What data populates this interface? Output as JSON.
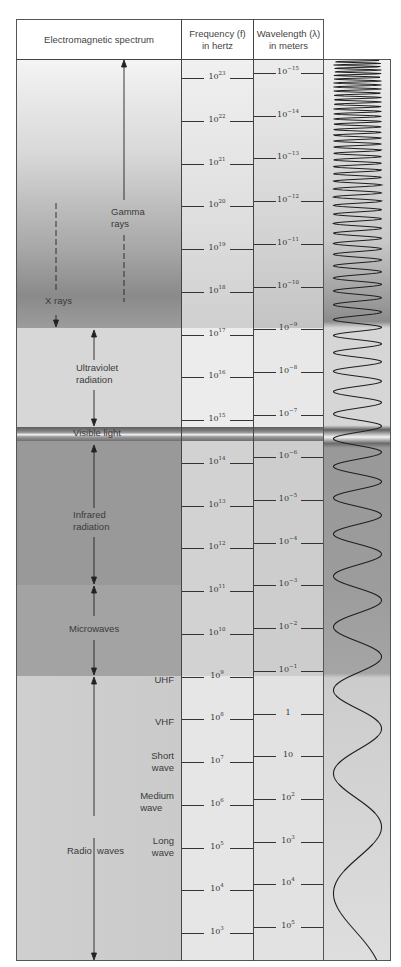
{
  "header": {
    "spectrum": "Electromagnetic spectrum",
    "frequency_line1": "Frequency (f)",
    "frequency_line2": "in hertz",
    "wavelength_line1": "Wavelength (λ)",
    "wavelength_line2": "in meters"
  },
  "regions": [
    {
      "name": "Gamma rays",
      "line1": "Gamma",
      "line2": "rays"
    },
    {
      "name": "X rays",
      "line1": "X rays"
    },
    {
      "name": "Ultraviolet radiation",
      "line1": "Ultraviolet",
      "line2": "radiation"
    },
    {
      "name": "Visible light",
      "line1": "Visible light"
    },
    {
      "name": "Infrared radiation",
      "line1": "Infrared",
      "line2": "radiation"
    },
    {
      "name": "Microwaves",
      "line1": "Microwaves"
    },
    {
      "name": "Radio waves",
      "line1": "Radio  waves"
    }
  ],
  "radio_subbands": [
    {
      "line1": "UHF"
    },
    {
      "line1": "VHF"
    },
    {
      "line1": "Short",
      "line2": "wave"
    },
    {
      "line1": "Medium",
      "line2": "wave"
    },
    {
      "line1": "Long",
      "line2": "wave"
    }
  ],
  "frequency_ticks": [
    {
      "base": "10",
      "exp": "23"
    },
    {
      "base": "10",
      "exp": "22"
    },
    {
      "base": "10",
      "exp": "21"
    },
    {
      "base": "10",
      "exp": "20"
    },
    {
      "base": "10",
      "exp": "19"
    },
    {
      "base": "10",
      "exp": "18"
    },
    {
      "base": "10",
      "exp": "17"
    },
    {
      "base": "10",
      "exp": "16"
    },
    {
      "base": "10",
      "exp": "15"
    },
    {
      "base": "10",
      "exp": "14"
    },
    {
      "base": "10",
      "exp": "13"
    },
    {
      "base": "10",
      "exp": "12"
    },
    {
      "base": "10",
      "exp": "11"
    },
    {
      "base": "10",
      "exp": "10"
    },
    {
      "base": "10",
      "exp": "9"
    },
    {
      "base": "10",
      "exp": "8"
    },
    {
      "base": "10",
      "exp": "7"
    },
    {
      "base": "10",
      "exp": "6"
    },
    {
      "base": "10",
      "exp": "5"
    },
    {
      "base": "10",
      "exp": "4"
    },
    {
      "base": "10",
      "exp": "3"
    }
  ],
  "wavelength_ticks": [
    {
      "base": "10",
      "exp": "−15"
    },
    {
      "base": "10",
      "exp": "−14"
    },
    {
      "base": "10",
      "exp": "−13"
    },
    {
      "base": "10",
      "exp": "−12"
    },
    {
      "base": "10",
      "exp": "−11"
    },
    {
      "base": "10",
      "exp": "−10"
    },
    {
      "base": "10",
      "exp": "−9"
    },
    {
      "base": "10",
      "exp": "−8"
    },
    {
      "base": "10",
      "exp": "−7"
    },
    {
      "base": "10",
      "exp": "−6"
    },
    {
      "base": "10",
      "exp": "−5"
    },
    {
      "base": "10",
      "exp": "−4"
    },
    {
      "base": "10",
      "exp": "−3"
    },
    {
      "base": "10",
      "exp": "−2"
    },
    {
      "base": "10",
      "exp": "−1"
    },
    {
      "base": "1",
      "exp": ""
    },
    {
      "base": "10",
      "exp": ""
    },
    {
      "base": "10",
      "exp": "2"
    },
    {
      "base": "10",
      "exp": "3"
    },
    {
      "base": "10",
      "exp": "4"
    },
    {
      "base": "10",
      "exp": "5"
    }
  ],
  "colors": {
    "gamma_top": "#f2f2f2",
    "gamma_bottom": "#8f8f8f",
    "xray": "#9c9c9c",
    "ultraviolet": "#d6d6d6",
    "visible_dark": "#6a6a6a",
    "visible_light": "#efefef",
    "infrared": "#9a9a9a",
    "microwave": "#a4a4a4",
    "radio_top": "#cfcfcf",
    "radio_bottom": "#dcdcdc",
    "scale_column": "#e4e4e4",
    "line": "#333333"
  },
  "chart_data": {
    "type": "table",
    "title": "Electromagnetic spectrum",
    "columns": [
      "Electromagnetic spectrum",
      "Frequency (f) in hertz",
      "Wavelength (λ) in meters"
    ],
    "frequency_hz_exponents": [
      23,
      22,
      21,
      20,
      19,
      18,
      17,
      16,
      15,
      14,
      13,
      12,
      11,
      10,
      9,
      8,
      7,
      6,
      5,
      4,
      3
    ],
    "wavelength_m_exponents": [
      -15,
      -14,
      -13,
      -12,
      -11,
      -10,
      -9,
      -8,
      -7,
      -6,
      -5,
      -4,
      -3,
      -2,
      -1,
      0,
      1,
      2,
      3,
      4,
      5
    ],
    "regions": [
      {
        "name": "Gamma rays",
        "freq_exp_range": [
          18.3,
          23.5
        ]
      },
      {
        "name": "X rays",
        "freq_exp_range": [
          17,
          20
        ]
      },
      {
        "name": "Ultraviolet radiation",
        "freq_exp_range": [
          15,
          17
        ]
      },
      {
        "name": "Visible light",
        "freq_exp_range": [
          14.5,
          15
        ]
      },
      {
        "name": "Infrared radiation",
        "freq_exp_range": [
          11,
          14.5
        ]
      },
      {
        "name": "Microwaves",
        "freq_exp_range": [
          9,
          11
        ]
      },
      {
        "name": "Radio waves",
        "freq_exp_range": [
          2.5,
          9
        ]
      }
    ],
    "radio_subbands": [
      {
        "name": "UHF",
        "freq_exp": 9
      },
      {
        "name": "VHF",
        "freq_exp": 8
      },
      {
        "name": "Short wave",
        "freq_exp": 7
      },
      {
        "name": "Medium wave",
        "freq_exp": 6
      },
      {
        "name": "Long wave",
        "freq_exp": 5
      }
    ]
  }
}
